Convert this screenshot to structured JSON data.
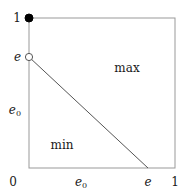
{
  "figure": {
    "title": "",
    "background_color": "#ffffff",
    "line_color": "#555555",
    "border_color": "#999999",
    "text_color": "#1a1a1a",
    "marker_filled_color": "#000000",
    "marker_open_fill": "#ffffff"
  },
  "axes": {
    "x_label": "",
    "y_label": "",
    "x_ticks": [
      {
        "id": "x-0",
        "label": "0",
        "sub": "",
        "value": 0.0
      },
      {
        "id": "x-e0",
        "label": "e",
        "sub": "0",
        "value": 0.355
      },
      {
        "id": "x-e",
        "label": "e",
        "sub": "",
        "value": 0.815
      },
      {
        "id": "x-1",
        "label": "1",
        "sub": "",
        "value": 1.0
      }
    ],
    "y_ticks": [
      {
        "id": "y-0",
        "label": "0",
        "sub": "",
        "value": 0.0
      },
      {
        "id": "y-e0",
        "label": "e",
        "sub": "0",
        "value": 0.387
      },
      {
        "id": "y-e",
        "label": "e",
        "sub": "",
        "value": 0.74
      },
      {
        "id": "y-1",
        "label": "1",
        "sub": "",
        "value": 1.0
      }
    ]
  },
  "regions": [
    {
      "id": "region-max",
      "label": "max",
      "x": 0.67,
      "y": 0.667
    },
    {
      "id": "region-min",
      "label": "min",
      "x": 0.225,
      "y": 0.153
    }
  ],
  "chart_data": {
    "type": "line",
    "title": "",
    "xlabel": "",
    "ylabel": "",
    "xlim": [
      0,
      1
    ],
    "ylim": [
      0,
      1
    ],
    "grid": false,
    "legend": "none",
    "frame": "box",
    "series": [
      {
        "name": "boundary",
        "type": "line",
        "x": [
          0.0,
          0.815
        ],
        "y": [
          0.74,
          0.0
        ],
        "style": "solid",
        "color": "#555555"
      }
    ],
    "points": [
      {
        "name": "top-left-filled",
        "x": 0.0,
        "y": 1.0,
        "marker": "filled-circle",
        "color": "#000000"
      },
      {
        "name": "intercept-open",
        "x": 0.0,
        "y": 0.74,
        "marker": "open-circle",
        "color": "#555555"
      }
    ],
    "annotations": [
      {
        "text": "max",
        "x": 0.67,
        "y": 0.667
      },
      {
        "text": "min",
        "x": 0.225,
        "y": 0.153
      }
    ],
    "xtick_labels": [
      "0",
      "e₀",
      "e",
      "1"
    ],
    "xtick_values": [
      0.0,
      0.355,
      0.815,
      1.0
    ],
    "ytick_labels": [
      "0",
      "e₀",
      "e",
      "1"
    ],
    "ytick_values": [
      0.0,
      0.387,
      0.74,
      1.0
    ]
  }
}
